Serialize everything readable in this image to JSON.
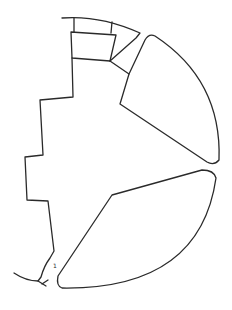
{
  "diagram": {
    "type": "segmented-circle-line-drawing",
    "stroke_color": "#2a2a2a",
    "background": "#ffffff",
    "label_mark": "1",
    "regions": [
      {
        "name": "top-arc-strip"
      },
      {
        "name": "upper-left-box"
      },
      {
        "name": "small-triangle"
      },
      {
        "name": "upper-right-segment"
      },
      {
        "name": "stepped-left-region"
      },
      {
        "name": "lower-right-segment"
      }
    ]
  }
}
